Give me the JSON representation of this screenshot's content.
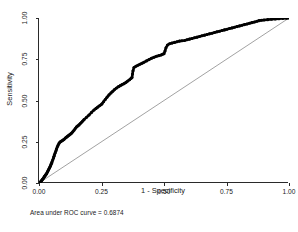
{
  "figure": {
    "background": "#ffffff",
    "curve_color": "#000000",
    "reference_color": "#7a7a7a",
    "axis_color": "#2a2a2a"
  },
  "axes": {
    "x_title": "1 - Specificity",
    "y_title": "Sensitivity",
    "x_ticks": [
      "0.00",
      "0.25",
      "0.50",
      "0.75",
      "1.00"
    ],
    "y_ticks": [
      "0.00",
      "0.25",
      "0.50",
      "0.75",
      "1.00"
    ]
  },
  "caption": {
    "auc_text": "Area under ROC curve = 0.6874"
  },
  "chart_data": {
    "type": "line",
    "title": "",
    "subtitle": "",
    "xlabel": "1 - Specificity",
    "ylabel": "Sensitivity",
    "xlim": [
      0.0,
      1.0
    ],
    "ylim": [
      0.0,
      1.0
    ],
    "xticks": [
      0.0,
      0.25,
      0.5,
      0.75,
      1.0
    ],
    "yticks": [
      0.0,
      0.25,
      0.5,
      0.75,
      1.0
    ],
    "xtick_labels": [
      "0.00",
      "0.25",
      "0.50",
      "0.75",
      "1.00"
    ],
    "ytick_labels": [
      "0.00",
      "0.25",
      "0.50",
      "0.75",
      "1.00"
    ],
    "grid": false,
    "legend": false,
    "legend_position": "none",
    "annotations": [
      "Area under ROC curve = 0.6874"
    ],
    "auc": 0.6874,
    "series": [
      {
        "name": "ROC curve",
        "style": "markers-dense",
        "color": "#000000",
        "x": [
          0.0,
          0.004,
          0.008,
          0.01,
          0.012,
          0.014,
          0.016,
          0.018,
          0.02,
          0.022,
          0.024,
          0.026,
          0.028,
          0.03,
          0.032,
          0.034,
          0.036,
          0.038,
          0.04,
          0.042,
          0.044,
          0.046,
          0.048,
          0.05,
          0.052,
          0.055,
          0.058,
          0.06,
          0.062,
          0.065,
          0.068,
          0.07,
          0.073,
          0.076,
          0.08,
          0.084,
          0.088,
          0.092,
          0.096,
          0.1,
          0.105,
          0.11,
          0.115,
          0.12,
          0.125,
          0.13,
          0.135,
          0.14,
          0.145,
          0.15,
          0.155,
          0.16,
          0.165,
          0.17,
          0.175,
          0.18,
          0.19,
          0.2,
          0.21,
          0.22,
          0.228,
          0.235,
          0.242,
          0.248,
          0.252,
          0.258,
          0.265,
          0.272,
          0.28,
          0.288,
          0.295,
          0.302,
          0.31,
          0.318,
          0.325,
          0.332,
          0.34,
          0.348,
          0.355,
          0.362,
          0.368,
          0.372,
          0.374,
          0.376,
          0.38,
          0.388,
          0.396,
          0.404,
          0.412,
          0.42,
          0.43,
          0.44,
          0.45,
          0.46,
          0.47,
          0.48,
          0.488,
          0.494,
          0.5,
          0.504,
          0.508,
          0.514,
          0.522,
          0.532,
          0.542,
          0.552,
          0.562,
          0.572,
          0.582,
          0.592,
          0.602,
          0.612,
          0.622,
          0.632,
          0.642,
          0.652,
          0.662,
          0.672,
          0.682,
          0.692,
          0.702,
          0.712,
          0.722,
          0.732,
          0.742,
          0.752,
          0.762,
          0.772,
          0.782,
          0.792,
          0.802,
          0.812,
          0.822,
          0.832,
          0.842,
          0.852,
          0.862,
          0.872,
          0.88,
          0.89,
          0.9,
          0.915,
          0.93,
          0.945,
          0.96,
          0.975,
          0.99,
          1.0
        ],
        "y": [
          0.0,
          0.005,
          0.01,
          0.014,
          0.018,
          0.022,
          0.026,
          0.03,
          0.035,
          0.04,
          0.044,
          0.048,
          0.052,
          0.056,
          0.062,
          0.068,
          0.074,
          0.08,
          0.086,
          0.092,
          0.098,
          0.104,
          0.112,
          0.12,
          0.128,
          0.14,
          0.152,
          0.162,
          0.172,
          0.184,
          0.196,
          0.206,
          0.218,
          0.228,
          0.24,
          0.248,
          0.252,
          0.256,
          0.26,
          0.264,
          0.272,
          0.278,
          0.284,
          0.29,
          0.296,
          0.302,
          0.31,
          0.32,
          0.33,
          0.34,
          0.346,
          0.352,
          0.36,
          0.368,
          0.376,
          0.384,
          0.398,
          0.412,
          0.428,
          0.442,
          0.452,
          0.46,
          0.468,
          0.474,
          0.48,
          0.492,
          0.506,
          0.52,
          0.534,
          0.546,
          0.556,
          0.566,
          0.576,
          0.584,
          0.59,
          0.596,
          0.602,
          0.61,
          0.618,
          0.626,
          0.634,
          0.64,
          0.66,
          0.68,
          0.7,
          0.708,
          0.714,
          0.72,
          0.726,
          0.732,
          0.74,
          0.748,
          0.756,
          0.762,
          0.768,
          0.772,
          0.776,
          0.78,
          0.784,
          0.8,
          0.82,
          0.836,
          0.844,
          0.848,
          0.852,
          0.856,
          0.86,
          0.862,
          0.864,
          0.868,
          0.872,
          0.876,
          0.88,
          0.884,
          0.888,
          0.892,
          0.896,
          0.9,
          0.904,
          0.908,
          0.912,
          0.916,
          0.92,
          0.924,
          0.928,
          0.932,
          0.936,
          0.94,
          0.944,
          0.948,
          0.952,
          0.956,
          0.96,
          0.964,
          0.968,
          0.972,
          0.976,
          0.98,
          0.984,
          0.986,
          0.988,
          0.99,
          0.992,
          0.994,
          0.996,
          0.998,
          0.999,
          1.0
        ]
      },
      {
        "name": "Reference line",
        "style": "thin-line",
        "color": "#7a7a7a",
        "x": [
          0.0,
          1.0
        ],
        "y": [
          0.0,
          1.0
        ]
      }
    ]
  }
}
